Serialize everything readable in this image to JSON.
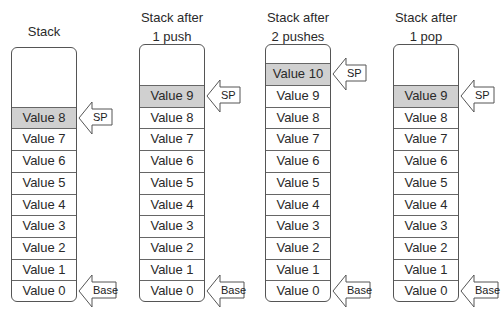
{
  "diagram": {
    "columns": [
      {
        "title": "Stack",
        "values": [
          "Value 8",
          "Value 7",
          "Value 6",
          "Value 5",
          "Value 4",
          "Value 3",
          "Value 2",
          "Value 1",
          "Value 0"
        ],
        "sp_value": "Value 8",
        "sp_label": "SP",
        "base_label": "Base"
      },
      {
        "title": "Stack after\n1 push",
        "values": [
          "Value 9",
          "Value 8",
          "Value 7",
          "Value 6",
          "Value 5",
          "Value 4",
          "Value 3",
          "Value 2",
          "Value 1",
          "Value 0"
        ],
        "sp_value": "Value 9",
        "sp_label": "SP",
        "base_label": "Base"
      },
      {
        "title": "Stack after\n2 pushes",
        "values": [
          "Value 10",
          "Value 9",
          "Value 8",
          "Value 7",
          "Value 6",
          "Value 5",
          "Value 4",
          "Value 3",
          "Value 2",
          "Value 1",
          "Value 0"
        ],
        "sp_value": "Value 10",
        "sp_label": "SP",
        "base_label": "Base"
      },
      {
        "title": "Stack after\n1 pop",
        "values": [
          "Value 9",
          "Value 8",
          "Value 7",
          "Value 6",
          "Value 5",
          "Value 4",
          "Value 3",
          "Value 2",
          "Value 1",
          "Value 0"
        ],
        "sp_value": "Value 9",
        "sp_label": "SP",
        "base_label": "Base"
      }
    ],
    "colors": {
      "sp_row_fill": "#d0d0d0",
      "border": "#555555",
      "text": "#2a2a2a"
    }
  }
}
